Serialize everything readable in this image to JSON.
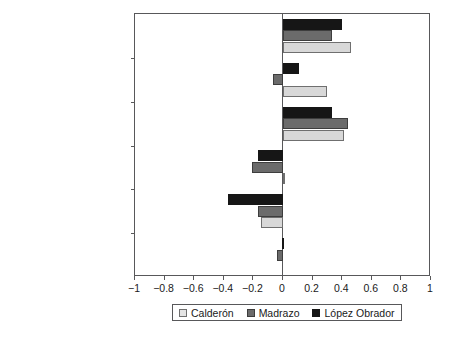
{
  "chart_data": {
    "type": "bar",
    "orientation": "horizontal",
    "title": "",
    "xlabel": "",
    "ylabel": "",
    "xlim": [
      -1,
      1
    ],
    "grid": false,
    "legend_position": "bottom",
    "xticks": [
      "-1",
      "-0.8",
      "-0.6",
      "-0.4",
      "-0.2",
      "0",
      "0.2",
      "0.4",
      "0.6",
      "0.8",
      "1"
    ],
    "xtick_values": [
      -1,
      -0.8,
      -0.6,
      -0.4,
      -0.2,
      0,
      0.2,
      0.4,
      0.6,
      0.8,
      1
    ],
    "categories": [
      "Social safety net",
      "Poverty reduction",
      "Economic ties with U.S.",
      "Electricity privatization",
      "Abortion",
      "Death penalty"
    ],
    "pole_labels_left": [
      "redistribution",
      "public\nresponsibility",
      "diminish",
      "oppose",
      "pro-choice",
      "oppose"
    ],
    "pole_labels_right": [
      "investment",
      "individual\nresponsibility",
      "expand",
      "favor",
      "pro-life",
      "favor"
    ],
    "series": [
      {
        "name": "Calderón",
        "color": "#d8d8d8",
        "edge_color": "#6f6f6f",
        "values": [
          0.46,
          0.3,
          0.41,
          0.01,
          -0.15,
          0.0
        ]
      },
      {
        "name": "Madrazo",
        "color": "#6b6b6b",
        "edge_color": "#3d3d3d",
        "values": [
          0.33,
          -0.07,
          0.44,
          -0.21,
          -0.17,
          -0.04
        ]
      },
      {
        "name": "López Obrador",
        "color": "#161616",
        "edge_color": "#161616",
        "values": [
          0.4,
          0.11,
          0.33,
          -0.17,
          -0.37,
          -0.01
        ]
      }
    ]
  },
  "axis": {
    "left_labels": [
      {
        "text": "Social safety net"
      },
      {
        "text": "Poverty reduction"
      },
      {
        "text": "Economic ties with U.S."
      },
      {
        "text": "Electricity privatization"
      },
      {
        "text": "Abortion"
      },
      {
        "text": "Death penalty"
      }
    ],
    "pole_left": [
      {
        "line1": "redistribution",
        "line2": ""
      },
      {
        "line1": "public",
        "line2": "responsibility"
      },
      {
        "line1": "diminish",
        "line2": ""
      },
      {
        "line1": "oppose",
        "line2": ""
      },
      {
        "line1": "pro-choice",
        "line2": ""
      },
      {
        "line1": "oppose",
        "line2": ""
      }
    ],
    "pole_right": [
      {
        "line1": "investment",
        "line2": ""
      },
      {
        "line1": "individual",
        "line2": "responsibility"
      },
      {
        "line1": "expand",
        "line2": ""
      },
      {
        "line1": "favor",
        "line2": ""
      },
      {
        "line1": "pro-life",
        "line2": ""
      },
      {
        "line1": "favor",
        "line2": ""
      }
    ],
    "xticklabels": [
      "−1",
      "−0.8",
      "−0.6",
      "−0.4",
      "−0.2",
      "0",
      "0.2",
      "0.4",
      "0.6",
      "0.8",
      "1"
    ]
  },
  "legend": {
    "entries": [
      {
        "label": "Calderón",
        "swatch": "calderon"
      },
      {
        "label": "Madrazo",
        "swatch": "madrazo"
      },
      {
        "label": "López Obrador",
        "swatch": "lopez"
      }
    ]
  }
}
